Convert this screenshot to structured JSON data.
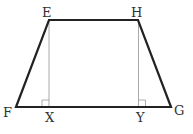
{
  "diagram": {
    "type": "trapezoid",
    "colors": {
      "outline": "#222222",
      "altitude": "#aaaaaa",
      "label": "#333333"
    },
    "vertices": {
      "E": {
        "label": "E",
        "x": 49,
        "y": 20
      },
      "H": {
        "label": "H",
        "x": 138,
        "y": 20
      },
      "G": {
        "label": "G",
        "x": 171,
        "y": 107
      },
      "F": {
        "label": "F",
        "x": 16,
        "y": 107
      }
    },
    "feet": {
      "X": {
        "label": "X",
        "x": 49,
        "y": 107
      },
      "Y": {
        "label": "Y",
        "x": 139,
        "y": 107
      }
    },
    "segments": [
      {
        "from": "E",
        "to": "H",
        "kind": "side"
      },
      {
        "from": "H",
        "to": "G",
        "kind": "side"
      },
      {
        "from": "G",
        "to": "F",
        "kind": "side"
      },
      {
        "from": "F",
        "to": "E",
        "kind": "side"
      },
      {
        "from": "E",
        "to": "X",
        "kind": "altitude"
      },
      {
        "from": "H",
        "to": "Y",
        "kind": "altitude"
      }
    ],
    "right_angle_marks": [
      "X",
      "Y"
    ],
    "labels": {
      "E": "E",
      "H": "H",
      "F": "F",
      "G": "G",
      "X": "X",
      "Y": "Y"
    }
  }
}
